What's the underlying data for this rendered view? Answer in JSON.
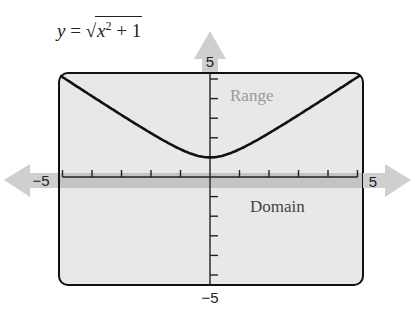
{
  "chart_data": {
    "type": "line",
    "equation": {
      "lhs": "y",
      "equals": "=",
      "radical": "√",
      "radicand_var": "x",
      "radicand_exp": "2",
      "radicand_rest": "+ 1"
    },
    "xlabel": "Domain",
    "ylabel": "Range",
    "xlim": [
      -5,
      5
    ],
    "ylim": [
      -5,
      5
    ],
    "x_tick_step": 1,
    "y_tick_step": 1,
    "tick_labels": {
      "x_min": "−5",
      "x_max": "5",
      "y_min": "−5",
      "y_max": "5"
    },
    "grid": false,
    "series": [
      {
        "name": "y = sqrt(x^2 + 1)",
        "x": [
          -5,
          -4,
          -3,
          -2,
          -1,
          0,
          1,
          2,
          3,
          4,
          5
        ],
        "y": [
          5.1,
          4.12,
          3.16,
          2.24,
          1.41,
          1.0,
          1.41,
          2.24,
          3.16,
          4.12,
          5.1
        ]
      }
    ],
    "annotations": [
      {
        "text": "Range",
        "note": "highlighted range band along y-axis"
      },
      {
        "text": "Domain",
        "note": "highlighted domain band along x-axis"
      }
    ],
    "colors": {
      "frame_fill": "#e8e8e8",
      "band": "#c4c4c4",
      "arrow": "#cfcfcf",
      "curve": "#111111",
      "label_gray": "#9a9a9a",
      "label_dark": "#444444"
    }
  }
}
